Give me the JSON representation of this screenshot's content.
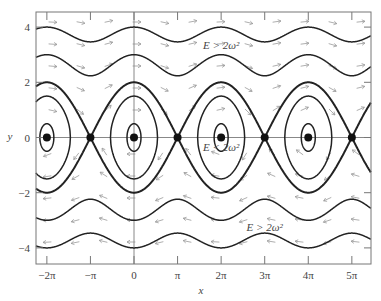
{
  "figure": {
    "xlabel": "x",
    "ylabel": "y",
    "x_ticks": [
      {
        "value": -6.2832,
        "label": "−2π"
      },
      {
        "value": -3.1416,
        "label": "−π"
      },
      {
        "value": 0,
        "label": "0"
      },
      {
        "value": 3.1416,
        "label": "π"
      },
      {
        "value": 6.2832,
        "label": "2π"
      },
      {
        "value": 9.4248,
        "label": "3π"
      },
      {
        "value": 12.5664,
        "label": "4π"
      },
      {
        "value": 15.708,
        "label": "5π"
      }
    ],
    "y_ticks": [
      {
        "value": 4,
        "label": "4"
      },
      {
        "value": 2,
        "label": "2"
      },
      {
        "value": 0,
        "label": "0"
      },
      {
        "value": -2,
        "label": "−2"
      },
      {
        "value": -4,
        "label": "−4"
      }
    ],
    "annotations": [
      {
        "text": "E > 2ω²",
        "x": 6.2832,
        "y": 3.35
      },
      {
        "text": "E < 2ω²",
        "x": 6.2832,
        "y": -0.35
      },
      {
        "text": "E > 2ω²",
        "x": 9.4248,
        "y": -3.25
      }
    ],
    "centers_x": [
      -6.2832,
      0,
      6.2832,
      12.5664
    ],
    "saddles_x": [
      -3.1416,
      3.1416,
      9.4248,
      15.708
    ],
    "omega": 1,
    "separatrix_amplitude": 2,
    "closed_orbit_amplitudes": [
      0.5,
      1.5
    ],
    "rotating_orbit_energies": [
      3.0,
      4.0
    ]
  },
  "chart_data": {
    "type": "line",
    "title": "",
    "xlabel": "x",
    "ylabel": "y",
    "xlim": [
      -6.8,
      16.5
    ],
    "ylim": [
      -4.5,
      4.6
    ],
    "x_tick_labels": [
      "−2π",
      "−π",
      "0",
      "π",
      "2π",
      "3π",
      "4π",
      "5π"
    ],
    "y_tick_labels": [
      "−4",
      "−2",
      "0",
      "2",
      "4"
    ],
    "series": [
      {
        "name": "separatrix (E = 2ω²)",
        "equation": "y = ±2 cos(x/2)",
        "style": "thick"
      },
      {
        "name": "libration orbit (small)",
        "y_max": 0.5
      },
      {
        "name": "libration orbit (large)",
        "y_max": 1.5
      },
      {
        "name": "rotation orbit upper 1 (E > 2ω²)",
        "y_range": [
          2.24,
          3.0
        ]
      },
      {
        "name": "rotation orbit upper 2 (E > 2ω²)",
        "y_range": [
          3.46,
          4.0
        ]
      },
      {
        "name": "rotation orbit lower 1 (E > 2ω²)",
        "y_range": [
          -3.0,
          -2.24
        ]
      },
      {
        "name": "rotation orbit lower 2 (E > 2ω²)",
        "y_range": [
          -4.0,
          -3.46
        ]
      }
    ],
    "fixed_points": {
      "stable_centers": [
        [
          -6.2832,
          0
        ],
        [
          0,
          0
        ],
        [
          6.2832,
          0
        ],
        [
          12.5664,
          0
        ]
      ],
      "saddles": [
        [
          -3.1416,
          0
        ],
        [
          3.1416,
          0
        ],
        [
          9.4248,
          0
        ],
        [
          15.708,
          0
        ]
      ]
    },
    "annotations": [
      "E > 2ω²",
      "E < 2ω²",
      "E > 2ω²"
    ],
    "direction_field": "arrows point right for y>0, left for y<0",
    "grid": false
  }
}
